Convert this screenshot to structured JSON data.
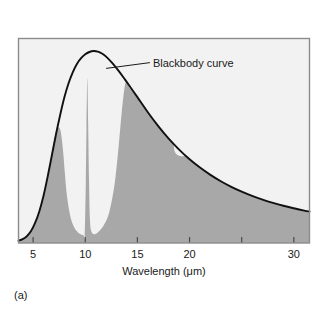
{
  "figure": {
    "panel_label": "(a)",
    "background_color": "#ffffff",
    "plot_background_color": "#f2f2f2",
    "frame_color": "#8c8c8c",
    "fill_color": "#a8a8a8",
    "curve_color": "#111111"
  },
  "chart_data": {
    "type": "area",
    "title": "",
    "subtitle": "",
    "xlabel": "Wavelength (μm)",
    "ylabel": "",
    "xlim": [
      3.6,
      31.5
    ],
    "ylim": [
      0,
      1.06
    ],
    "x_scale": "linear",
    "grid": false,
    "legend": null,
    "xticks": [
      5,
      10,
      15,
      20,
      25,
      30
    ],
    "xtick_labels": [
      "5",
      "10",
      "15",
      "20",
      "",
      "30"
    ],
    "yticks": [],
    "ytick_labels": [],
    "annotations": [
      {
        "text": "Blackbody curve",
        "target_x": 12.0,
        "target_y": 0.905,
        "label_x": 16.2,
        "label_y": 0.935,
        "leader": true
      }
    ],
    "series": [
      {
        "name": "Blackbody curve",
        "kind": "line",
        "color": "#111111",
        "x": [
          3.6,
          4.0,
          4.4,
          4.8,
          5.2,
          5.6,
          6.0,
          6.4,
          6.8,
          7.2,
          7.6,
          8.0,
          8.4,
          8.8,
          9.2,
          9.6,
          10.0,
          10.4,
          10.8,
          11.2,
          11.6,
          12.0,
          12.6,
          13.2,
          13.8,
          14.4,
          15.0,
          16.0,
          17.0,
          18.0,
          19.0,
          20.0,
          21.0,
          22.0,
          23.0,
          24.0,
          25.0,
          26.0,
          27.0,
          28.0,
          29.0,
          30.0,
          31.0,
          31.5
        ],
        "y": [
          0.012,
          0.02,
          0.035,
          0.062,
          0.105,
          0.165,
          0.245,
          0.345,
          0.455,
          0.565,
          0.665,
          0.755,
          0.828,
          0.885,
          0.928,
          0.958,
          0.978,
          0.99,
          0.995,
          0.992,
          0.982,
          0.966,
          0.932,
          0.892,
          0.848,
          0.802,
          0.756,
          0.678,
          0.606,
          0.541,
          0.484,
          0.434,
          0.391,
          0.353,
          0.32,
          0.291,
          0.266,
          0.244,
          0.225,
          0.208,
          0.193,
          0.18,
          0.168,
          0.163
        ]
      },
      {
        "name": "Observed emission spectrum",
        "kind": "area",
        "color": "#a8a8a8",
        "x": [
          3.6,
          4.0,
          4.4,
          4.8,
          5.2,
          5.6,
          6.0,
          6.4,
          6.7,
          7.0,
          7.2,
          7.4,
          7.6,
          7.75,
          7.9,
          8.05,
          8.2,
          8.45,
          8.7,
          9.0,
          9.3,
          9.6,
          9.85,
          9.95,
          10.05,
          10.12,
          10.2,
          10.28,
          10.36,
          10.45,
          10.6,
          10.9,
          11.3,
          11.8,
          12.3,
          12.8,
          13.2,
          13.5,
          13.75,
          13.9,
          14.0,
          14.1,
          14.3,
          15.0,
          16.0,
          17.0,
          17.8,
          18.2,
          18.45,
          18.6,
          19.0,
          19.4,
          19.7,
          20.0,
          20.4,
          21.0,
          22.0,
          23.0,
          24.0,
          25.0,
          26.0,
          27.0,
          28.0,
          29.0,
          30.0,
          31.0,
          31.5
        ],
        "y": [
          0.012,
          0.02,
          0.035,
          0.062,
          0.105,
          0.165,
          0.245,
          0.345,
          0.44,
          0.53,
          0.575,
          0.6,
          0.588,
          0.54,
          0.46,
          0.36,
          0.265,
          0.17,
          0.113,
          0.075,
          0.055,
          0.044,
          0.039,
          0.038,
          0.3,
          0.6,
          0.855,
          0.62,
          0.33,
          0.12,
          0.058,
          0.046,
          0.06,
          0.095,
          0.16,
          0.3,
          0.5,
          0.68,
          0.8,
          0.835,
          0.836,
          0.826,
          0.801,
          0.756,
          0.678,
          0.606,
          0.556,
          0.53,
          0.513,
          0.47,
          0.452,
          0.45,
          0.452,
          0.434,
          0.419,
          0.391,
          0.353,
          0.32,
          0.291,
          0.266,
          0.244,
          0.225,
          0.208,
          0.193,
          0.18,
          0.168,
          0.163
        ]
      }
    ]
  }
}
